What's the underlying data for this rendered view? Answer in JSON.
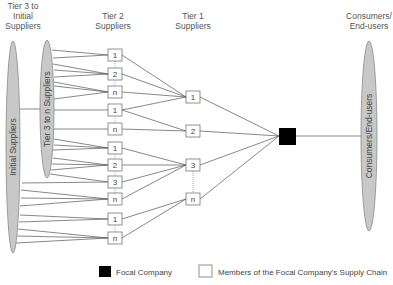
{
  "headers": {
    "tier3": [
      "Tier 3 to",
      "Initial",
      "Suppliers"
    ],
    "tier2": [
      "Tier 2",
      "Suppliers"
    ],
    "tier1": [
      "Tier 1",
      "Suppliers"
    ],
    "consumers": [
      "Consumers/",
      "End-users"
    ]
  },
  "ellipses": {
    "initial": "Initial Suppliers",
    "tier3n": "Tier 3 to n Suppliers",
    "consumers": "Consumers/End-users"
  },
  "tier2_boxes": [
    "1",
    "2",
    "n",
    "1",
    "n",
    "1",
    "2",
    "3",
    "n",
    "1",
    "n"
  ],
  "tier1_boxes": [
    "1",
    "2",
    "3",
    "n"
  ],
  "legend": {
    "focal": "Focal Company",
    "members": "Members of the Focal Company's Supply Chain"
  },
  "colors": {
    "ellipse_fill": "#c8c8c8",
    "ellipse_stroke": "#8a8a8a",
    "line": "#555555",
    "focal": "#000000",
    "box_stroke": "#777777"
  }
}
